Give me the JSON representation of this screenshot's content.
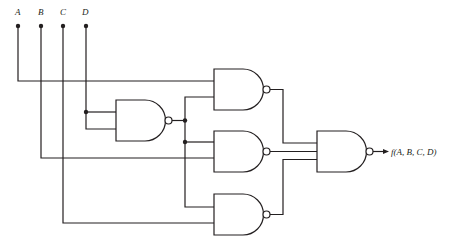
{
  "diagram": {
    "type": "logic-circuit",
    "inputs": [
      {
        "label": "A",
        "x": 18
      },
      {
        "label": "B",
        "x": 41
      },
      {
        "label": "C",
        "x": 63
      },
      {
        "label": "D",
        "x": 86
      }
    ],
    "output_label": "f(A, B, C, D)",
    "gates": [
      {
        "id": "g0",
        "type": "NAND",
        "inputs": [
          "D",
          "D"
        ]
      },
      {
        "id": "g1",
        "type": "NAND",
        "inputs": [
          "A",
          "g0"
        ]
      },
      {
        "id": "g2",
        "type": "NAND",
        "inputs": [
          "g0",
          "B"
        ]
      },
      {
        "id": "g3",
        "type": "NAND",
        "inputs": [
          "g0",
          "C"
        ]
      },
      {
        "id": "g4",
        "type": "NAND",
        "inputs": [
          "g1",
          "g2",
          "g3"
        ],
        "output": "f(A, B, C, D)"
      }
    ],
    "colors": {
      "line": "#231f20",
      "background": "#ffffff"
    }
  }
}
